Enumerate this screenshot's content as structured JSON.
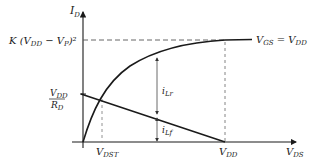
{
  "diagram": {
    "type": "characteristic-curve-with-load-line",
    "axes": {
      "y_label_main": "I",
      "y_label_sub": "D",
      "x_label_main": "V",
      "x_label_sub": "DS"
    },
    "levels": {
      "k_label_prefix": "K (V",
      "k_label_sub1": "DD",
      "k_label_mid": " − V",
      "k_label_sub2": "P",
      "k_label_suffix": ")²"
    },
    "curve_label": {
      "left_main": "V",
      "left_sub": "GS",
      "eq": " = V",
      "right_sub": "DD"
    },
    "load_line_intercept": {
      "num_main": "V",
      "num_sub": "DD",
      "den_main": "R",
      "den_sub": "D"
    },
    "x_ticks": [
      {
        "main": "V",
        "sub": "DST"
      },
      {
        "main": "V",
        "sub": "DD"
      }
    ],
    "currents": [
      {
        "main": "i",
        "sub": "Lr"
      },
      {
        "main": "i",
        "sub": "Lf"
      }
    ],
    "colors": {
      "line": "#1a1a1a",
      "dashed": "#555555",
      "background": "#ffffff"
    }
  }
}
